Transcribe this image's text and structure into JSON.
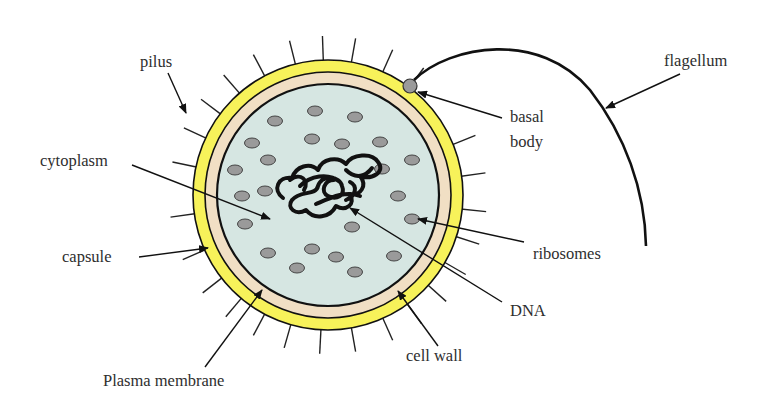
{
  "diagram": {
    "colors": {
      "capsule": "#f7f25a",
      "cell_wall": "#f1dfc4",
      "cytoplasm": "#d6e6e2",
      "ribosome": "#9a9a9a",
      "basal_body": "#9a9a9a",
      "outline": "#111111",
      "text": "#2e2e2e"
    },
    "cell": {
      "cx": 328,
      "cy": 195,
      "r_capsule": 135,
      "r_wall": 123,
      "r_membrane": 111
    },
    "labels": [
      {
        "id": "pilus",
        "text": "pilus",
        "x": 140,
        "y": 67,
        "arrow": {
          "x1": 168,
          "y1": 73,
          "x2": 186,
          "y2": 113
        }
      },
      {
        "id": "flagellum",
        "text": "flagellum",
        "x": 664,
        "y": 66,
        "arrow": {
          "x1": 680,
          "y1": 74,
          "x2": 606,
          "y2": 108
        }
      },
      {
        "id": "basal_body_1",
        "text": "basal",
        "x": 510,
        "y": 122,
        "arrow": {
          "x1": 502,
          "y1": 118,
          "x2": 418,
          "y2": 92
        }
      },
      {
        "id": "basal_body_2",
        "text": "body",
        "x": 510,
        "y": 147
      },
      {
        "id": "cytoplasm",
        "text": "cytoplasm",
        "x": 40,
        "y": 166,
        "arrow": {
          "x1": 132,
          "y1": 165,
          "x2": 270,
          "y2": 219
        }
      },
      {
        "id": "capsule",
        "text": "capsule",
        "x": 62,
        "y": 262,
        "arrow": {
          "x1": 139,
          "y1": 257,
          "x2": 208,
          "y2": 248
        }
      },
      {
        "id": "ribosomes",
        "text": "ribosomes",
        "x": 533,
        "y": 259,
        "arrow": {
          "x1": 524,
          "y1": 242,
          "x2": 418,
          "y2": 219
        }
      },
      {
        "id": "dna",
        "text": "DNA",
        "x": 510,
        "y": 316,
        "arrow": {
          "x1": 502,
          "y1": 302,
          "x2": 350,
          "y2": 208
        }
      },
      {
        "id": "cell_wall",
        "text": "cell wall",
        "x": 406,
        "y": 361,
        "arrow": {
          "x1": 438,
          "y1": 346,
          "x2": 398,
          "y2": 291
        }
      },
      {
        "id": "plasma_membrane",
        "text": "Plasma membrane",
        "x": 103,
        "y": 386,
        "arrow": {
          "x1": 205,
          "y1": 367,
          "x2": 262,
          "y2": 290
        }
      }
    ],
    "ribosomes": [
      [
        315,
        111
      ],
      [
        355,
        117
      ],
      [
        275,
        121
      ],
      [
        252,
        143
      ],
      [
        312,
        139
      ],
      [
        342,
        144
      ],
      [
        380,
        142
      ],
      [
        268,
        160
      ],
      [
        412,
        160
      ],
      [
        235,
        170
      ],
      [
        382,
        169
      ],
      [
        242,
        196
      ],
      [
        265,
        191
      ],
      [
        398,
        196
      ],
      [
        245,
        224
      ],
      [
        412,
        219
      ],
      [
        352,
        227
      ],
      [
        268,
        253
      ],
      [
        312,
        249
      ],
      [
        336,
        257
      ],
      [
        394,
        256
      ],
      [
        297,
        268
      ],
      [
        355,
        272
      ]
    ],
    "basal_body": {
      "cx": 410,
      "cy": 86,
      "r": 7
    },
    "flagellum_path": "M 414 80 C 450 45, 540 30, 590 90 C 625 135, 645 190, 646 246",
    "dna_path": "M 283 198 C 272 190, 278 176, 292 178 C 296 166, 310 162, 318 170 C 322 158, 338 156, 346 164 C 352 154, 372 152, 378 162 C 386 172, 372 180, 360 176 C 368 186, 360 196, 350 194 C 356 204, 346 212, 336 206 C 330 218, 314 220, 306 210 C 296 216, 286 208, 292 200 C 300 190, 316 196, 318 186 C 322 174, 340 176, 342 186 C 346 196, 336 200, 328 196 C 320 192, 324 180, 334 180 M 300 186 C 310 176, 328 172, 340 182 M 316 204 C 330 198, 346 190, 360 196 M 346 170 C 356 180, 366 176, 372 168 M 290 180 C 300 172, 310 180, 304 190 M 350 182 C 358 186, 356 196, 346 200",
    "pili_angles": [
      -168,
      -155,
      -143,
      -131,
      -118,
      -104,
      -92,
      -80,
      -66,
      -53,
      -22,
      -8,
      6,
      18,
      30,
      42,
      54,
      66,
      80,
      93,
      106,
      118,
      130,
      142,
      156,
      172
    ]
  }
}
